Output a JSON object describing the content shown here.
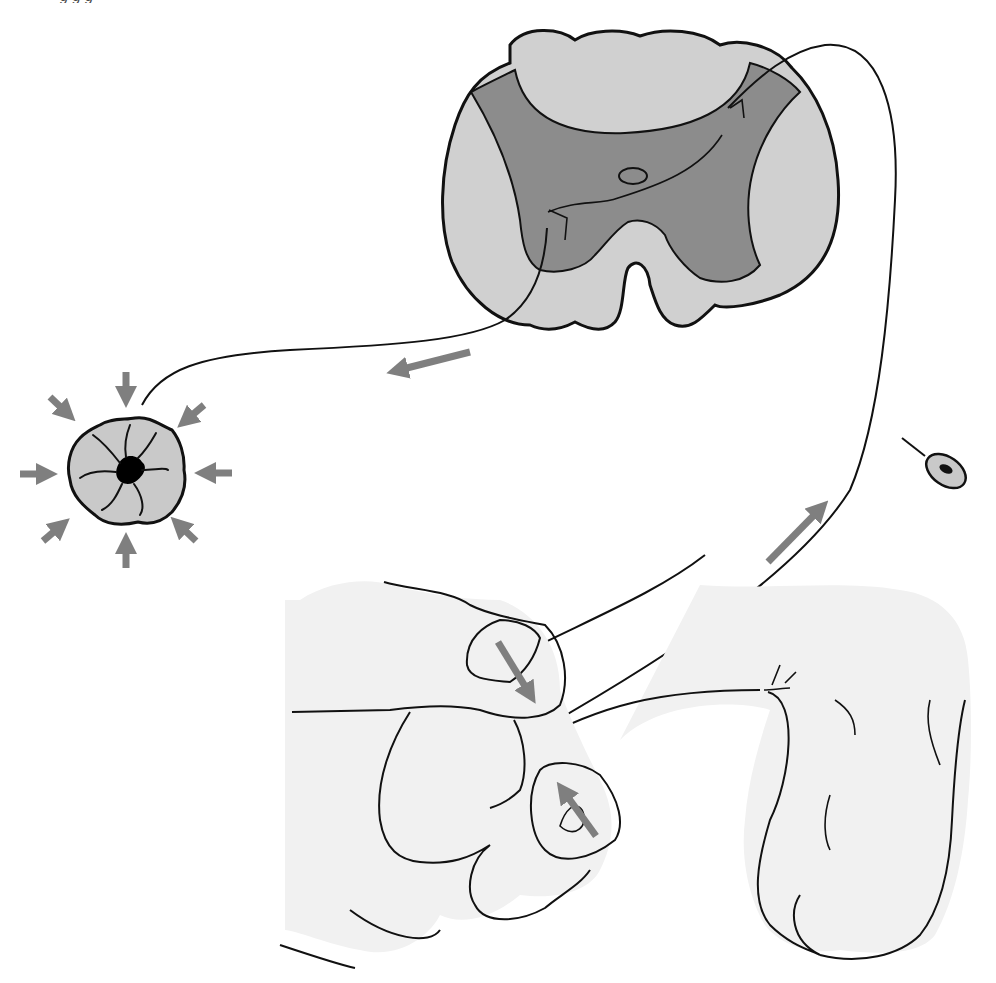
{
  "figure": {
    "caption_visible_fragment": "g        g          g"
  },
  "colors": {
    "background": "#ffffff",
    "outline": "#111111",
    "white_matter": "#d0d0d0",
    "gray_matter": "#8c8c8c",
    "skin": "#f1f1f1",
    "arrow": "#7f7f7f",
    "sphincter_fill": "#c9c9c9",
    "lumen": "#000000"
  },
  "elements": {
    "spinal_cord": {
      "label": "spinal-cord-cross-section"
    },
    "central_canal": {
      "label": "central-canal"
    },
    "afferent_nerve": {
      "label": "afferent-fiber"
    },
    "efferent_nerve": {
      "label": "efferent-fiber"
    },
    "ganglion": {
      "label": "dorsal-root-ganglion"
    },
    "sphincter": {
      "label": "anal-sphincter"
    },
    "hand": {
      "label": "examiner-hand"
    },
    "genitalia": {
      "label": "penis-scrotum"
    }
  },
  "arrows": [
    {
      "name": "efferent-direction-arrow",
      "x1": 470,
      "y1": 352,
      "x2": 382,
      "y2": 374
    },
    {
      "name": "afferent-direction-arrow",
      "x1": 768,
      "y1": 562,
      "x2": 832,
      "y2": 497
    },
    {
      "name": "squeeze-arrow-top",
      "x1": 498,
      "y1": 642,
      "x2": 537,
      "y2": 706
    },
    {
      "name": "squeeze-arrow-bottom",
      "x1": 596,
      "y1": 836,
      "x2": 556,
      "y2": 780
    },
    {
      "name": "sphincter-arrow-n",
      "x1": 126,
      "y1": 372,
      "x2": 126,
      "y2": 408
    },
    {
      "name": "sphincter-arrow-ne",
      "x1": 204,
      "y1": 405,
      "x2": 177,
      "y2": 428
    },
    {
      "name": "sphincter-arrow-e",
      "x1": 232,
      "y1": 473,
      "x2": 194,
      "y2": 473
    },
    {
      "name": "sphincter-arrow-se",
      "x1": 196,
      "y1": 541,
      "x2": 170,
      "y2": 517
    },
    {
      "name": "sphincter-arrow-s",
      "x1": 126,
      "y1": 568,
      "x2": 126,
      "y2": 532
    },
    {
      "name": "sphincter-arrow-sw",
      "x1": 43,
      "y1": 541,
      "x2": 70,
      "y2": 518
    },
    {
      "name": "sphincter-arrow-w",
      "x1": 20,
      "y1": 474,
      "x2": 58,
      "y2": 474
    },
    {
      "name": "sphincter-arrow-nw",
      "x1": 50,
      "y1": 397,
      "x2": 76,
      "y2": 421
    }
  ]
}
